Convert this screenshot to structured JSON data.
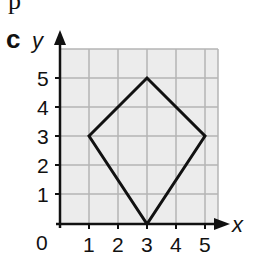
{
  "figure": {
    "top_fragment": "p",
    "part_label": "c",
    "x_axis_label": "x",
    "y_axis_label": "y",
    "origin_label": "0",
    "x_ticks": [
      "1",
      "2",
      "3",
      "4",
      "5"
    ],
    "y_ticks": [
      "1",
      "2",
      "3",
      "4",
      "5"
    ],
    "shape": "kite/rhombus-like quadrilateral",
    "vertices": [
      [
        1,
        3
      ],
      [
        3,
        5
      ],
      [
        5,
        3
      ],
      [
        3,
        0
      ]
    ],
    "colors": {
      "grid_background": "#ececec",
      "grid_lines": "#b5b5b5",
      "shape_stroke": "#111111",
      "axes": "#111111"
    }
  }
}
